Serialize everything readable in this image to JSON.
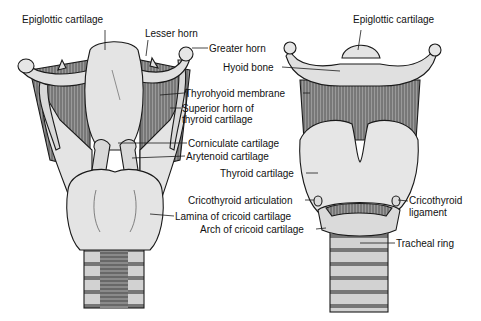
{
  "diagram": {
    "colors": {
      "cartilage": "#e4e4e4",
      "membrane": "#8c8c8c",
      "outline": "#1a1a1a",
      "trachea": "#bdbdbd",
      "label": "#111111"
    }
  },
  "left_view": {
    "labels": [
      {
        "text": "Epiglottic cartilage",
        "x": 22,
        "y": 19
      },
      {
        "text": "Lesser horn",
        "x": 145,
        "y": 30
      },
      {
        "text": "Greater horn",
        "x": 209,
        "y": 43
      },
      {
        "text": "Hyoid bone",
        "x": 223,
        "y": 62
      },
      {
        "text": "Thyrohyoid membrane",
        "x": 185,
        "y": 88
      },
      {
        "text": "Superior horn of",
        "x": 182,
        "y": 104
      },
      {
        "text": "thyroid cartilage",
        "x": 182,
        "y": 115
      },
      {
        "text": "Corniculate cartilage",
        "x": 188,
        "y": 138
      },
      {
        "text": "Arytenoid cartilage",
        "x": 186,
        "y": 151
      },
      {
        "text": "Lamina of cricoid cartilage",
        "x": 175,
        "y": 211
      }
    ]
  },
  "right_view": {
    "labels": [
      {
        "text": "Epiglottic cartilage",
        "x": 353,
        "y": 19
      },
      {
        "text": "Thyroid cartilage",
        "x": 220,
        "y": 168
      },
      {
        "text": "Cricothyroid articulation",
        "x": 188,
        "y": 195
      },
      {
        "text": "Arch of cricoid cartilage",
        "x": 200,
        "y": 224
      },
      {
        "text": "Cricothyroid",
        "x": 409,
        "y": 195
      },
      {
        "text": "ligament",
        "x": 409,
        "y": 207
      },
      {
        "text": "Tracheal ring",
        "x": 396,
        "y": 238
      }
    ]
  }
}
